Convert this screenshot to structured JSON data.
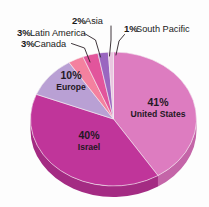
{
  "chart_data": {
    "type": "pie",
    "title": "",
    "subtitle": "",
    "xlabel": "",
    "ylabel": "",
    "legend_position": "none",
    "grid": false,
    "units": "percent",
    "total": 100,
    "style": "3d-pie",
    "background_color": "#fdfdfd",
    "categories": [
      "United States",
      "Israel",
      "Europe",
      "Canada",
      "Latin America",
      "Asia",
      "South Pacific"
    ],
    "values": [
      41,
      40,
      10,
      3,
      3,
      2,
      1
    ],
    "colors": [
      "#dd7cc0",
      "#c0359a",
      "#b9a0d4",
      "#f4819f",
      "#e2559c",
      "#9a66c0",
      "#e9c6e0"
    ],
    "slices": [
      {
        "label": "United States",
        "value": 41,
        "pct_text": "41%",
        "name_text": "United States",
        "color": "#dd7cc0",
        "side_color": "#c465a8",
        "label_placement": "inside"
      },
      {
        "label": "Israel",
        "value": 40,
        "pct_text": "40%",
        "name_text": "Israel",
        "color": "#c0359a",
        "side_color": "#a42b83",
        "label_placement": "inside"
      },
      {
        "label": "Europe",
        "value": 10,
        "pct_text": "10%",
        "name_text": "Europe",
        "color": "#b9a0d4",
        "side_color": "#9d86b8",
        "label_placement": "inside"
      },
      {
        "label": "Canada",
        "value": 3,
        "pct_text": "3%",
        "name_text": "Canada",
        "color": "#f4819f",
        "side_color": "#d66d88",
        "label_placement": "callout"
      },
      {
        "label": "Latin America",
        "value": 3,
        "pct_text": "3%",
        "name_text": "Latin America",
        "color": "#e2559c",
        "side_color": "#c44686",
        "label_placement": "callout"
      },
      {
        "label": "Asia",
        "value": 2,
        "pct_text": "2%",
        "name_text": "Asia",
        "color": "#9a66c0",
        "side_color": "#8355a5",
        "label_placement": "callout"
      },
      {
        "label": "South Pacific",
        "value": 1,
        "pct_text": "1%",
        "name_text": "South Pacific",
        "color": "#e9c6e0",
        "side_color": "#cba9c3",
        "label_placement": "callout"
      }
    ]
  },
  "callouts": {
    "latin_america": {
      "pct": "3%",
      "name": "Latin America"
    },
    "canada": {
      "pct": "3%",
      "name": "Canada"
    },
    "asia": {
      "pct": "2%",
      "name": "Asia"
    },
    "south_pacific": {
      "pct": "1%",
      "name": "South Pacific"
    }
  },
  "inside_labels": {
    "united_states": {
      "pct": "41%",
      "name": "United States"
    },
    "israel": {
      "pct": "40%",
      "name": "Israel"
    },
    "europe": {
      "pct": "10%",
      "name": "Europe"
    }
  }
}
